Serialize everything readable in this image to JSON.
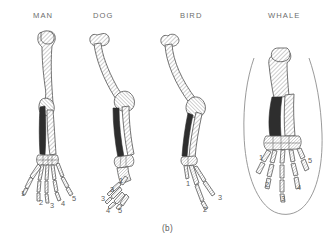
{
  "figure": {
    "caption": "(b)",
    "background_color": "#ffffff",
    "ink_color": "#555555",
    "dark_bone_color": "#2b2b2b",
    "hatch_color": "#8a8a8a",
    "label_color": "#6d6d6d"
  },
  "specimens": [
    {
      "id": "man",
      "label": "MAN",
      "label_x": 33,
      "label_y": 18,
      "digits": [
        {
          "number": "1",
          "x": 21,
          "y": 196
        },
        {
          "number": "2",
          "x": 39,
          "y": 205
        },
        {
          "number": "3",
          "x": 50,
          "y": 208
        },
        {
          "number": "4",
          "x": 61,
          "y": 206
        },
        {
          "number": "5",
          "x": 72,
          "y": 201
        }
      ]
    },
    {
      "id": "dog",
      "label": "DOG",
      "label_x": 93,
      "label_y": 18,
      "digits": [
        {
          "number": "1",
          "x": 119,
          "y": 183
        },
        {
          "number": "2",
          "x": 110,
          "y": 192
        },
        {
          "number": "3",
          "x": 101,
          "y": 201
        },
        {
          "number": "4",
          "x": 106,
          "y": 213
        },
        {
          "number": "5",
          "x": 118,
          "y": 213
        }
      ]
    },
    {
      "id": "bird",
      "label": "BIRD",
      "label_x": 180,
      "label_y": 18,
      "digits": [
        {
          "number": "1",
          "x": 186,
          "y": 186
        },
        {
          "number": "2",
          "x": 203,
          "y": 212
        },
        {
          "number": "3",
          "x": 218,
          "y": 200
        }
      ]
    },
    {
      "id": "whale",
      "label": "WHALE",
      "label_x": 268,
      "label_y": 18,
      "digits": [
        {
          "number": "1",
          "x": 259,
          "y": 160
        },
        {
          "number": "2",
          "x": 265,
          "y": 187
        },
        {
          "number": "3",
          "x": 281,
          "y": 201
        },
        {
          "number": "4",
          "x": 297,
          "y": 190
        },
        {
          "number": "5",
          "x": 308,
          "y": 163
        }
      ]
    }
  ]
}
